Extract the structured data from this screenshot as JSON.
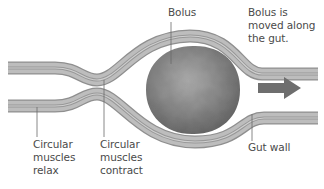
{
  "colors": {
    "wall_dark": "#8e8e8e",
    "wall_mid": "#b4b4b4",
    "wall_light": "#d2d2d2",
    "bolus": "#8a8a8a",
    "arrow": "#6e6e6e",
    "leader": "#6a6a6a",
    "text": "#4a4a4a"
  },
  "labels": {
    "bolus": "Bolus",
    "movement": [
      "Bolus is",
      "moved along",
      "the gut."
    ],
    "relax": [
      "Circular",
      "muscles",
      "relax"
    ],
    "contract": [
      "Circular",
      "muscles",
      "contract"
    ],
    "gut_wall": "Gut wall"
  },
  "icons": {
    "direction_arrow": "right-arrow"
  }
}
